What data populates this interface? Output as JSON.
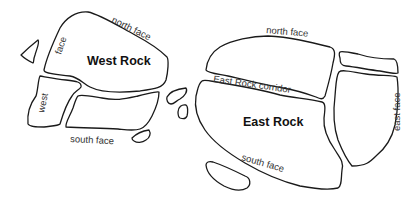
{
  "diagram": {
    "type": "rock-map-outline",
    "stroke_color": "#1a1a1a",
    "background": "#ffffff",
    "west_rock": {
      "title": "West Rock",
      "labels": {
        "north_face": "north face",
        "face": "face",
        "west": "west",
        "south_face": "south face"
      }
    },
    "east_rock": {
      "title": "East Rock",
      "labels": {
        "north_face": "north face",
        "corridor": "East Rock corridor",
        "east_face": "east face",
        "south_face": "south face"
      }
    }
  }
}
